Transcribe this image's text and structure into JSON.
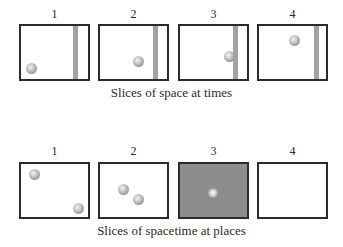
{
  "top_row": {
    "caption": "Slices of space at times",
    "panels": [
      {
        "label": "1",
        "shaded": false,
        "bar": true,
        "balls": [
          {
            "x": 10,
            "y": 40
          }
        ]
      },
      {
        "label": "2",
        "shaded": false,
        "bar": true,
        "balls": [
          {
            "x": 38,
            "y": 35
          }
        ]
      },
      {
        "label": "3",
        "shaded": false,
        "bar": true,
        "balls": [
          {
            "x": 47,
            "y": 30
          }
        ]
      },
      {
        "label": "4",
        "shaded": false,
        "bar": true,
        "balls": [
          {
            "x": 31,
            "y": 11
          }
        ]
      }
    ]
  },
  "bottom_row": {
    "caption": "Slices of spacetime at places",
    "panels": [
      {
        "label": "1",
        "shaded": false,
        "bar": false,
        "balls": [
          {
            "x": 11,
            "y": 8
          },
          {
            "x": 55,
            "y": 42
          }
        ]
      },
      {
        "label": "2",
        "shaded": false,
        "bar": false,
        "balls": [
          {
            "x": 21,
            "y": 23
          },
          {
            "x": 36,
            "y": 33
          }
        ]
      },
      {
        "label": "3",
        "shaded": true,
        "bar": false,
        "balls": [
          {
            "x": 30,
            "y": 29
          }
        ]
      },
      {
        "label": "4",
        "shaded": false,
        "bar": false,
        "balls": []
      }
    ]
  },
  "colors": {
    "border": "#2b2b2b",
    "bar": "#a3a3a3",
    "shaded_panel": "#8d8d8d",
    "text": "#2a2a2a"
  }
}
